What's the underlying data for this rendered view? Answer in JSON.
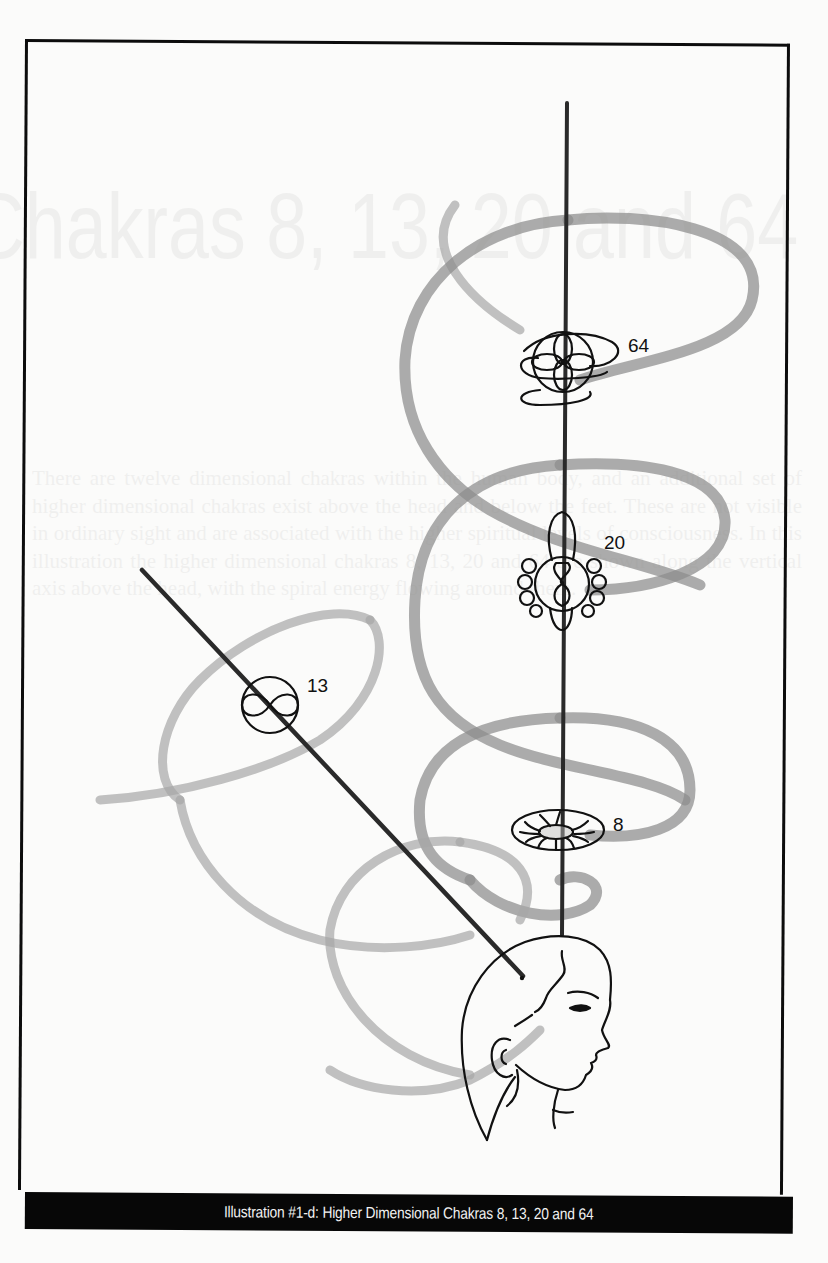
{
  "illustration": {
    "caption": "Illustration #1-d: Higher Dimensional Chakras 8, 13, 20 and 64",
    "chakras": [
      {
        "id": "64",
        "label": "64",
        "symbol": "looped-orb"
      },
      {
        "id": "20",
        "label": "20",
        "symbol": "petaled-orb"
      },
      {
        "id": "13",
        "label": "13",
        "symbol": "infinity-circle"
      },
      {
        "id": "8",
        "label": "8",
        "symbol": "spoked-disk"
      }
    ],
    "figure": "head-profile",
    "colors": {
      "ink": "#111111",
      "spiral": "#8c8c8c",
      "caption_bar": "#070707",
      "caption_text": "#f2f2f2",
      "paper": "#fbfbfa"
    }
  },
  "bleed_through": {
    "title": "Chakras 8, 13, 20 and 64",
    "body": "There are twelve dimensional chakras within the human body, and an additional set of higher dimensional chakras exist above the head and below the feet. These are not visible in ordinary sight and are associated with the higher spiritual levels of consciousness. In this illustration the higher dimensional chakras 8, 13, 20 and 64 are shown along the vertical axis above the head, with the spiral energy flowing around them."
  }
}
